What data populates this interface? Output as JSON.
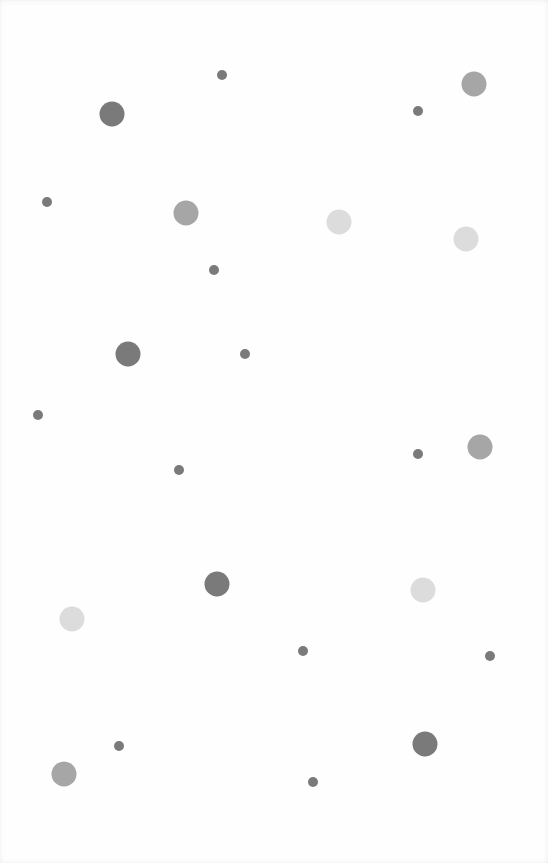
{
  "game": {
    "board": {
      "width": 548,
      "height": 863,
      "background": "#fefefe"
    },
    "palette": {
      "dark": "#7a7a7a",
      "medium": "#a6a6a6",
      "light": "#dcdcdc"
    },
    "sizes": {
      "small": 10,
      "large": 25
    },
    "circles": [
      {
        "x": 222,
        "y": 75,
        "size": "small",
        "tone": "dark"
      },
      {
        "x": 418,
        "y": 111,
        "size": "small",
        "tone": "dark"
      },
      {
        "x": 474,
        "y": 84,
        "size": "large",
        "tone": "medium"
      },
      {
        "x": 112,
        "y": 114,
        "size": "large",
        "tone": "dark"
      },
      {
        "x": 47,
        "y": 202,
        "size": "small",
        "tone": "dark"
      },
      {
        "x": 186,
        "y": 213,
        "size": "large",
        "tone": "medium"
      },
      {
        "x": 339,
        "y": 222,
        "size": "large",
        "tone": "light"
      },
      {
        "x": 466,
        "y": 239,
        "size": "large",
        "tone": "light"
      },
      {
        "x": 214,
        "y": 270,
        "size": "small",
        "tone": "dark"
      },
      {
        "x": 128,
        "y": 354,
        "size": "large",
        "tone": "dark"
      },
      {
        "x": 245,
        "y": 354,
        "size": "small",
        "tone": "dark"
      },
      {
        "x": 38,
        "y": 415,
        "size": "small",
        "tone": "dark"
      },
      {
        "x": 480,
        "y": 447,
        "size": "large",
        "tone": "medium"
      },
      {
        "x": 418,
        "y": 454,
        "size": "small",
        "tone": "dark"
      },
      {
        "x": 179,
        "y": 470,
        "size": "small",
        "tone": "dark"
      },
      {
        "x": 217,
        "y": 584,
        "size": "large",
        "tone": "dark"
      },
      {
        "x": 423,
        "y": 590,
        "size": "large",
        "tone": "light"
      },
      {
        "x": 72,
        "y": 619,
        "size": "large",
        "tone": "light"
      },
      {
        "x": 303,
        "y": 651,
        "size": "small",
        "tone": "dark"
      },
      {
        "x": 490,
        "y": 656,
        "size": "small",
        "tone": "dark"
      },
      {
        "x": 425,
        "y": 744,
        "size": "large",
        "tone": "dark"
      },
      {
        "x": 119,
        "y": 746,
        "size": "small",
        "tone": "dark"
      },
      {
        "x": 64,
        "y": 774,
        "size": "large",
        "tone": "medium"
      },
      {
        "x": 313,
        "y": 782,
        "size": "small",
        "tone": "dark"
      }
    ]
  }
}
